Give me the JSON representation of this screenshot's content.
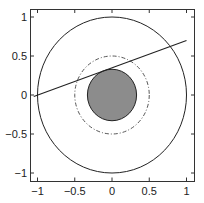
{
  "chart_data": {
    "type": "line",
    "title": "",
    "xlabel": "",
    "ylabel": "",
    "xlim": [
      -1.1,
      1.1
    ],
    "ylim": [
      -1.1,
      1.1
    ],
    "grid": false,
    "legend": null,
    "x_ticks": [
      -1,
      -0.5,
      0,
      0.5,
      1
    ],
    "x_tick_labels": [
      "−1",
      "−0.5",
      "0",
      "0.5",
      "1"
    ],
    "y_ticks": [
      1,
      0.5,
      0,
      -0.5,
      -1
    ],
    "y_tick_labels": [
      "1",
      "0.5",
      "0",
      "−0.5",
      "−1"
    ],
    "series": [
      {
        "name": "outer-circle",
        "kind": "circle",
        "center": [
          0,
          0
        ],
        "radius": 1.0,
        "style": "solid",
        "color": "#222222",
        "fill": "none"
      },
      {
        "name": "dashdot-circle",
        "kind": "circle",
        "center": [
          0,
          0
        ],
        "radius": 0.5,
        "style": "dashdot",
        "color": "#444444",
        "fill": "none"
      },
      {
        "name": "filled-disk",
        "kind": "circle",
        "center": [
          0,
          0
        ],
        "radius": 0.33,
        "style": "solid",
        "color": "#222222",
        "fill": "#8c8c8c"
      },
      {
        "name": "tangent-line",
        "kind": "line",
        "x": [
          -1.05,
          1.0
        ],
        "y": [
          -0.02,
          0.7
        ],
        "style": "solid",
        "color": "#222222"
      }
    ]
  },
  "colors": {
    "axes": "#333333",
    "line": "#222222",
    "disk_fill": "#8c8c8c",
    "background": "#ffffff"
  }
}
